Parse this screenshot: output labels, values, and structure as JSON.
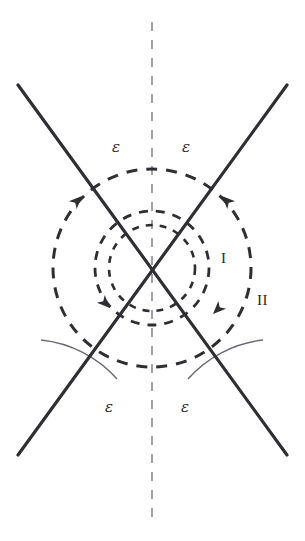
{
  "figure": {
    "background_color": "#ffffff",
    "stroke_color": "#2f2f33",
    "thin_stroke_color": "#6a6a70",
    "axis_color": "#8a8a90",
    "center": {
      "x": 152,
      "y": 268
    },
    "labels": [
      {
        "name": "epsilon-top-left",
        "text": "ε",
        "x": 112,
        "y": 140,
        "style": "eps"
      },
      {
        "name": "epsilon-top-right",
        "text": "ε",
        "x": 182,
        "y": 140,
        "style": "eps"
      },
      {
        "name": "region-label-one",
        "text": "I",
        "x": 221,
        "y": 251,
        "style": "roman"
      },
      {
        "name": "region-label-two",
        "text": "II",
        "x": 257,
        "y": 293,
        "style": "roman"
      },
      {
        "name": "epsilon-bottom-left",
        "text": "ε",
        "x": 105,
        "y": 400,
        "style": "eps"
      },
      {
        "name": "epsilon-bottom-right",
        "text": "ε",
        "x": 181,
        "y": 400,
        "style": "eps"
      }
    ],
    "circles": [
      {
        "name": "dashed-circle-inner",
        "radius": 43,
        "dash": "7 7",
        "width": 2.6
      },
      {
        "name": "dashed-circle-middle",
        "radius": 57,
        "dash": "9 8",
        "width": 2.8
      },
      {
        "name": "dashed-circle-outer",
        "radius": 99,
        "dash": "11 9",
        "width": 3.0
      }
    ],
    "lines": [
      {
        "name": "solid-line-descending",
        "x1": 18,
        "y1": 85,
        "x2": 287,
        "y2": 455
      },
      {
        "name": "solid-line-ascending",
        "x1": 18,
        "y1": 455,
        "x2": 287,
        "y2": 85
      }
    ],
    "vertical_axis": {
      "name": "dashed-symmetry-axis",
      "x": 152,
      "y1": 22,
      "y2": 519,
      "dash": "9 9",
      "width": 1.6
    },
    "angle_arcs": [
      {
        "name": "angle-arc-bottom-left",
        "radius": 118,
        "start_deg": 200,
        "end_deg": 252
      },
      {
        "name": "angle-arc-bottom-right",
        "radius": 118,
        "start_deg": 288,
        "end_deg": 340
      }
    ],
    "arrowheads": [
      {
        "name": "arrowhead-outer-upper-left",
        "x": 82,
        "y": 196,
        "rotation_deg": -45
      },
      {
        "name": "arrowhead-outer-upper-right",
        "x": 222,
        "y": 196,
        "rotation_deg": 225
      },
      {
        "name": "arrowhead-outer-lower-right",
        "x": 213,
        "y": 314,
        "rotation_deg": 135
      },
      {
        "name": "arrowhead-inner-lower-left",
        "x": 110,
        "y": 308,
        "rotation_deg": 45
      }
    ]
  }
}
